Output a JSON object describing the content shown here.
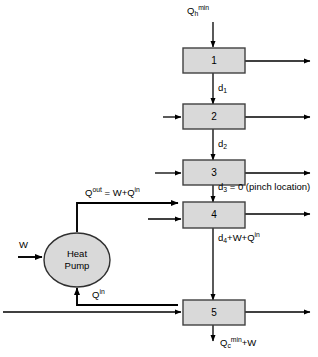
{
  "diagram": {
    "colors": {
      "box_fill": "#d9d9d9",
      "box_stroke": "#404040",
      "line": "#000000",
      "pump_fill": "#d9d9d9",
      "pump_stroke": "#303030",
      "background": "#ffffff"
    },
    "intervals": [
      {
        "id": "interval-1",
        "label": "1"
      },
      {
        "id": "interval-2",
        "label": "2"
      },
      {
        "id": "interval-3",
        "label": "3"
      },
      {
        "id": "interval-4",
        "label": "4"
      },
      {
        "id": "interval-5",
        "label": "5"
      }
    ],
    "pump": {
      "line1": "Heat",
      "line2": "Pump"
    },
    "labels": {
      "hot_utility": {
        "base": "Q",
        "sub": "h",
        "sup": "min"
      },
      "d1": {
        "base": "d",
        "sub": "1"
      },
      "d2": {
        "base": "d",
        "sub": "2"
      },
      "d3": {
        "base": "d",
        "sub": "3",
        "suffix": " = 0 (pinch location)"
      },
      "d4": {
        "base": "d",
        "sub": "4",
        "suffix": "+W+Q",
        "suffix_sup": "in"
      },
      "q_out": {
        "base": "Q",
        "sup": "out",
        "eq": " = W+Q",
        "eq_sup": "in"
      },
      "q_in": {
        "base": "Q",
        "sup": "in"
      },
      "work": {
        "base": "W"
      },
      "cold_utility": {
        "base": "Q",
        "sub": "c",
        "sup": "min",
        "suffix": "+W"
      }
    }
  }
}
